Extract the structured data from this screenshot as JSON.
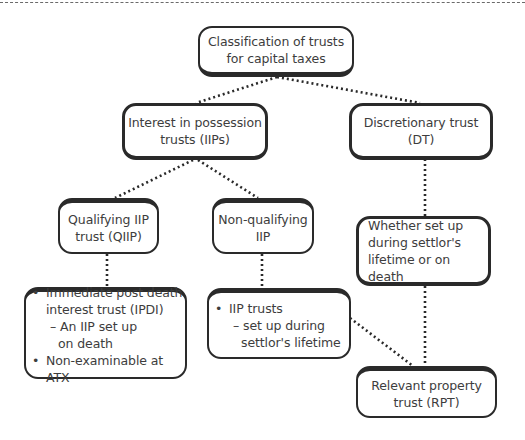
{
  "diagram": {
    "type": "hierarchy-tree",
    "root": {
      "id": "root",
      "lines": [
        "Classification of trusts",
        "for capital taxes"
      ]
    },
    "nodes": {
      "iip": {
        "lines": [
          "Interest in possession",
          "trusts (IIPs)"
        ]
      },
      "dt": {
        "lines": [
          "Discretionary trust",
          "(DT)"
        ]
      },
      "qiip": {
        "lines": [
          "Qualifying IIP",
          "trust (QIIP)"
        ]
      },
      "nqiip": {
        "lines": [
          "Non-qualifying",
          "IIP"
        ]
      },
      "whether": {
        "lines": [
          "Whether set up",
          "during settlor's",
          "lifetime or on death"
        ]
      },
      "ipdi": {
        "bullets": [
          {
            "bullet": "•",
            "lines": [
              "Immediate post death",
              "interest trust (IPDI)"
            ],
            "sub": [
              "– An IIP set up",
              "on death"
            ]
          },
          {
            "bullet": "•",
            "lines": [
              "Non-examinable at ATX"
            ]
          }
        ]
      },
      "iip_trusts": {
        "bullets": [
          {
            "bullet": "•",
            "lines": [
              "IIP trusts"
            ],
            "sub": [
              "– set up during",
              "settlor's lifetime"
            ]
          }
        ]
      },
      "rpt": {
        "lines": [
          "Relevant property",
          "trust (RPT)"
        ]
      }
    },
    "edges": [
      {
        "from": "root",
        "to": "iip"
      },
      {
        "from": "root",
        "to": "dt"
      },
      {
        "from": "iip",
        "to": "qiip"
      },
      {
        "from": "iip",
        "to": "nqiip"
      },
      {
        "from": "dt",
        "to": "whether"
      },
      {
        "from": "qiip",
        "to": "ipdi"
      },
      {
        "from": "nqiip",
        "to": "iip_trusts"
      },
      {
        "from": "whether",
        "to": "rpt"
      },
      {
        "from": "iip_trusts",
        "to": "rpt"
      }
    ],
    "colors": {
      "border": "#2a2a2a",
      "text": "#3d3d3d",
      "connector": "#2a2a2a",
      "background": "#ffffff"
    }
  }
}
